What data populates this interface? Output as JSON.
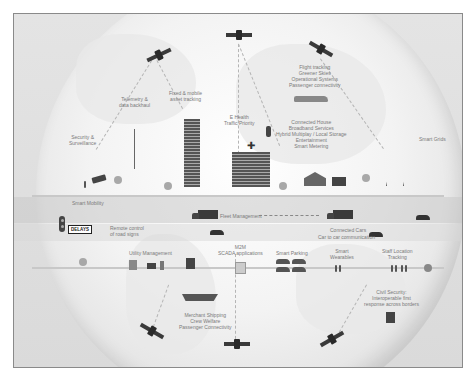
{
  "diagram": {
    "title": "",
    "theme": {
      "background": "#e0e0e0",
      "globe": "#f2f2f2",
      "icon": "#3a3a3a",
      "text": "#7a7a7a",
      "border": "#8a8a8a"
    },
    "satellites": [
      {
        "id": "sat-top-left",
        "position": "top-left"
      },
      {
        "id": "sat-top-center",
        "position": "top-center"
      },
      {
        "id": "sat-top-right",
        "position": "top-right"
      },
      {
        "id": "sat-bottom-left",
        "position": "bottom-left"
      },
      {
        "id": "sat-bottom-center",
        "position": "bottom-center"
      },
      {
        "id": "sat-bottom-right",
        "position": "bottom-right"
      }
    ],
    "labels": {
      "security": "Security &\nSurveillance",
      "telemetry": "Telemetry &\ndata backhaul",
      "fixed_mobile": "Fixed & mobile\nasset tracking",
      "ehealth": "E Health\nTraffic Priority",
      "flight": [
        "Flight tracking",
        "Greener Skies",
        "Operational Systems",
        "Passenger connectivity"
      ],
      "connected_house": [
        "Connected House",
        "Broadband Services",
        "Hybrid Multiplay / Local Storage",
        "Entertainment",
        "Smart Metering"
      ],
      "smart_grids": "Smart Grids",
      "smart_mobility": "Smart Mobility",
      "delays": "DELAYS",
      "remote_control": "Remote control\nof road signs",
      "fleet": "Fleet Management",
      "connected_cars": "Connected Cars",
      "car_to_car": "Car to car communication",
      "utility": "Utility Management",
      "m2m": "M2M\nSCADA applications",
      "smart_parking": "Smart Parking",
      "smart_wearables": "Smart\nWearables",
      "staff_tracking": "Staff Location\nTracking",
      "merchant": [
        "Merchant Shipping",
        "Crew Welfare",
        "Passenger Connectivity"
      ],
      "civil_security": [
        "Civil Security:",
        "Interoperable first",
        "response across borders"
      ]
    }
  }
}
